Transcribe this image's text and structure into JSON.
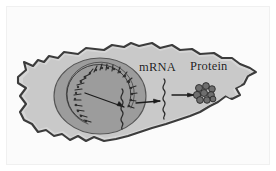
{
  "figure": {
    "background_color": "#ffffff",
    "frame_color": "#fbfbfb"
  },
  "labels": {
    "mrna": "mRNA",
    "protein": "Protein"
  },
  "colors": {
    "cytoplasm": "#c9c9c9",
    "membrane_band": "#d6d6d6",
    "membrane_outline": "#3c3c3c",
    "nucleus_fill": "#9c9c9c",
    "nucleus_outline": "#4a4a4a",
    "dna_stroke": "#2b2b2b",
    "arrow_stroke": "#1c1c1c",
    "ribosome_fill": "#6e6e6e",
    "ribosome_stroke": "#232323",
    "text": "#1c1c1c"
  },
  "structures": {
    "cell": {
      "name": "cell-membrane",
      "shape": "jagged amoeboid outline elongated left-to-right"
    },
    "nucleus": {
      "name": "nucleus",
      "shape": "oval",
      "cx": 100,
      "cy": 96,
      "rx": 46,
      "ry": 38
    },
    "dna": {
      "name": "dna-coil",
      "shape": "coiled helix arc open to the right inside the nucleus"
    },
    "transcription_arrow": {
      "name": "transcription-arrow",
      "from": "dna-coil",
      "to": "nuclear-mrna"
    },
    "nuclear_mrna": {
      "name": "nuclear-mrna-strand",
      "shape": "wavy vertical squiggle at the nuclear envelope"
    },
    "export_arrow": {
      "name": "mrna-export-arrow",
      "from": "nucleus",
      "to": "cytoplasmic-mrna"
    },
    "cytoplasmic_mrna": {
      "name": "cytoplasmic-mrna-strand",
      "shape": "wavy vertical squiggle in the cytoplasm"
    },
    "translation_arrow": {
      "name": "translation-arrow",
      "from": "cytoplasmic-mrna",
      "to": "protein-cluster"
    },
    "protein": {
      "name": "protein-cluster",
      "shape": "cluster of globular subunits",
      "subunit_count": 9
    }
  }
}
